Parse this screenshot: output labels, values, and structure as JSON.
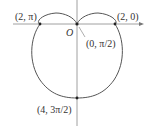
{
  "diagram": {
    "type": "polar-cardioid",
    "equation": "r = 2 - 2 sin θ",
    "axes": {
      "origin_label": "O",
      "x_axis_arrow": true,
      "y_axis": true
    },
    "points": [
      {
        "id": "p1",
        "label": "(2, π)",
        "r": 2,
        "theta": "π"
      },
      {
        "id": "p2",
        "label": "(2, 0)",
        "r": 2,
        "theta": "0"
      },
      {
        "id": "p3",
        "label": "(0, π/2)",
        "r": 0,
        "theta": "π/2"
      },
      {
        "id": "p4",
        "label": "(4, 3π/2)",
        "r": 4,
        "theta": "3π/2"
      }
    ],
    "colors": {
      "curve": "#555555",
      "axes": "#777777",
      "text": "#333333"
    }
  }
}
